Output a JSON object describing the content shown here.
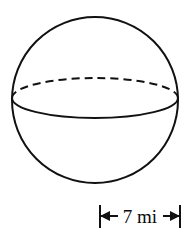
{
  "figure": {
    "shape_name": "sphere",
    "stroke_color": "#111111",
    "background_color": "#ffffff",
    "stroke_width": 2,
    "sphere": {
      "center_x": 95,
      "center_y": 100,
      "radius": 83,
      "equator": {
        "center_x": 95,
        "center_y": 98,
        "semi_major_axis": 83,
        "semi_minor_axis": 20,
        "back_arc_style": "dashed",
        "front_arc_style": "solid",
        "dash_length": 8,
        "dash_gap": 5
      }
    },
    "dimension": {
      "label": "7 mi",
      "value": "7",
      "unit": "mi",
      "measure_type": "radius",
      "line_y": 216,
      "start_x": 100,
      "end_x": 180,
      "left_tick_label": "|",
      "left_arrow_label": "←",
      "right_arrow_label": "→",
      "right_tick_label": "|"
    }
  }
}
